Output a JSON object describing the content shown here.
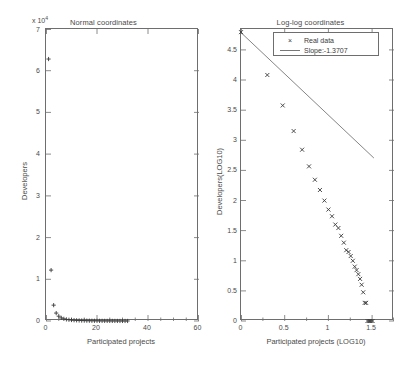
{
  "figure": {
    "background": "#ffffff",
    "axis_color": "#6e6e6e",
    "marker_color": "#3a3a3a",
    "fit_line_color": "#777777"
  },
  "chart_data": [
    {
      "type": "scatter",
      "id": "normal-coordinates",
      "title": "Normal coordinates",
      "xlabel": "Participated projects",
      "ylabel": "Developers",
      "y_multiplier_text": "x 10",
      "y_multiplier_exponent": "4",
      "y_multiplier_value": 10000,
      "xlim": [
        0,
        60
      ],
      "ylim": [
        0,
        7
      ],
      "xticks": [
        0,
        20,
        40,
        60
      ],
      "xticklabels": [
        "0",
        "20",
        "40",
        "60"
      ],
      "yticks": [
        0,
        1,
        2,
        3,
        4,
        5,
        6,
        7
      ],
      "yticklabels": [
        "0",
        "1",
        "2",
        "3",
        "4",
        "5",
        "6",
        "7"
      ],
      "minor_xticks": [
        5,
        10,
        15,
        25,
        30,
        35,
        45,
        50,
        55
      ],
      "grid": false,
      "marker": "+",
      "legend": null,
      "series": [
        {
          "name": "Developers per participated projects",
          "units": "x10^4 developers",
          "x": [
            1,
            2,
            3,
            4,
            5,
            6,
            7,
            8,
            9,
            10,
            11,
            12,
            13,
            14,
            15,
            16,
            17,
            18,
            19,
            20,
            21,
            22,
            23,
            24,
            25,
            26,
            27,
            28,
            29,
            30,
            31,
            32
          ],
          "y": [
            6.28,
            1.22,
            0.38,
            0.19,
            0.115,
            0.075,
            0.052,
            0.038,
            0.03,
            0.024,
            0.019,
            0.016,
            0.013,
            0.011,
            0.0095,
            0.008,
            0.007,
            0.006,
            0.0053,
            0.0046,
            0.004,
            0.0036,
            0.0032,
            0.0028,
            0.0025,
            0.0022,
            0.002,
            0.0018,
            0.0016,
            0.0014,
            0.0012,
            0.001
          ]
        }
      ]
    },
    {
      "type": "scatter",
      "id": "log-log-coordinates",
      "title": "Log-log coordinates",
      "xlabel": "Participated projects (LOG10)",
      "ylabel": "Developers(LOG10)",
      "xlim": [
        0,
        1.75
      ],
      "ylim": [
        0,
        4.85
      ],
      "xticks": [
        0,
        0.5,
        1,
        1.5
      ],
      "xticklabels": [
        "0",
        "0.5",
        "1",
        "1.5"
      ],
      "yticks": [
        0,
        0.5,
        1,
        1.5,
        2,
        2.5,
        3,
        3.5,
        4,
        4.5
      ],
      "yticklabels": [
        "0",
        "0.5",
        "1",
        "1.5",
        "2",
        "2.5",
        "3",
        "3.5",
        "4",
        "4.5"
      ],
      "minor_xticks": [
        0.25,
        0.75,
        1.25,
        1.75
      ],
      "grid": false,
      "marker": "x",
      "legend": {
        "position": "top-center",
        "entries": [
          {
            "label": "Real data",
            "key": "marker"
          },
          {
            "label": "Slope:-1.3707",
            "key": "line"
          }
        ]
      },
      "fit": {
        "label": "Slope:-1.3707",
        "slope": -1.3707,
        "intercept": 4.79,
        "x_start": 0.0,
        "x_end": 1.52
      },
      "series": [
        {
          "name": "Real data",
          "x": [
            0.0,
            0.301,
            0.477,
            0.602,
            0.699,
            0.778,
            0.845,
            0.903,
            0.954,
            1.0,
            1.041,
            1.079,
            1.114,
            1.146,
            1.176,
            1.204,
            1.23,
            1.255,
            1.279,
            1.301,
            1.322,
            1.342,
            1.362,
            1.38,
            1.398,
            1.415,
            1.431,
            1.447,
            1.462,
            1.477,
            1.491,
            1.505
          ],
          "y": [
            4.798,
            4.086,
            3.58,
            3.155,
            2.845,
            2.568,
            2.346,
            2.176,
            2.0,
            1.851,
            1.74,
            1.602,
            1.544,
            1.415,
            1.301,
            1.176,
            1.146,
            1.079,
            1.0,
            0.903,
            0.845,
            0.778,
            0.699,
            0.602,
            0.477,
            0.301,
            0.301,
            0.0,
            0.0,
            0.0,
            0.0,
            0.0
          ]
        }
      ]
    }
  ]
}
